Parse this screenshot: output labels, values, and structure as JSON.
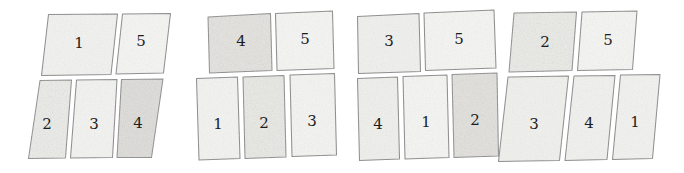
{
  "figure": {
    "panel_count": 4,
    "style": "pencil sketch on white paper",
    "colors": {
      "background": "#ffffff",
      "ink": "#8a8a8a",
      "label_ink": "#1d1d1d",
      "fill_light": "#f4f4f2",
      "fill_medium": "#eeeeea",
      "fill_dark": "#e2e1dc"
    }
  },
  "panels": [
    {
      "name": "panel-1",
      "index": 1,
      "skew": "right-leaning parallelogram",
      "cells": [
        {
          "label": "1",
          "row": "top",
          "shade": "light",
          "cx": 79,
          "cy": 43
        },
        {
          "label": "5",
          "row": "top",
          "shade": "light",
          "cx": 139,
          "cy": 41
        },
        {
          "label": "2",
          "row": "bottom",
          "shade": "medium",
          "cx": 46,
          "cy": 124
        },
        {
          "label": "3",
          "row": "bottom",
          "shade": "light",
          "cx": 93,
          "cy": 124
        },
        {
          "label": "4",
          "row": "bottom",
          "shade": "dark",
          "cx": 136,
          "cy": 123
        }
      ]
    },
    {
      "name": "panel-2",
      "index": 2,
      "skew": "slight tilt",
      "cells": [
        {
          "label": "4",
          "row": "top",
          "shade": "dark",
          "cx": 243,
          "cy": 40
        },
        {
          "label": "5",
          "row": "top",
          "shade": "light",
          "cx": 303,
          "cy": 38
        },
        {
          "label": "1",
          "row": "bottom",
          "shade": "light",
          "cx": 216,
          "cy": 124
        },
        {
          "label": "2",
          "row": "bottom",
          "shade": "medium",
          "cx": 262,
          "cy": 123
        },
        {
          "label": "3",
          "row": "bottom",
          "shade": "light",
          "cx": 309,
          "cy": 122
        }
      ]
    },
    {
      "name": "panel-3",
      "index": 3,
      "skew": "slight tilt",
      "cells": [
        {
          "label": "3",
          "row": "top",
          "shade": "light",
          "cx": 391,
          "cy": 41
        },
        {
          "label": "5",
          "row": "top",
          "shade": "light",
          "cx": 453,
          "cy": 38
        },
        {
          "label": "4",
          "row": "bottom",
          "shade": "light",
          "cx": 379,
          "cy": 123
        },
        {
          "label": "1",
          "row": "bottom",
          "shade": "light",
          "cx": 426,
          "cy": 122
        },
        {
          "label": "2",
          "row": "bottom",
          "shade": "dark",
          "cx": 473,
          "cy": 120
        }
      ]
    },
    {
      "name": "panel-4",
      "index": 4,
      "skew": "right-leaning parallelogram",
      "cells": [
        {
          "label": "2",
          "row": "top",
          "shade": "medium",
          "cx": 547,
          "cy": 42
        },
        {
          "label": "5",
          "row": "top",
          "shade": "light",
          "cx": 609,
          "cy": 40
        },
        {
          "label": "3",
          "row": "bottom",
          "shade": "light",
          "cx": 546,
          "cy": 124
        },
        {
          "label": "4",
          "row": "bottom",
          "shade": "light",
          "cx": 593,
          "cy": 123
        },
        {
          "label": "1",
          "row": "bottom",
          "shade": "light",
          "cx": 635,
          "cy": 122
        }
      ]
    }
  ]
}
